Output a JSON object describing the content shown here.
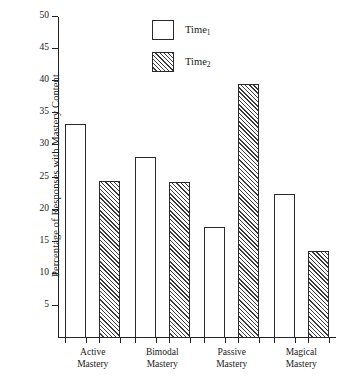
{
  "chart_data": {
    "type": "bar",
    "title": "",
    "xlabel": "",
    "ylabel": "Percentage of Responses with Mastery Content",
    "categories": [
      "Active Mastery",
      "Bimodal Mastery",
      "Passive Mastery",
      "Magical Mastery"
    ],
    "category_lines": [
      [
        "Active",
        "Mastery"
      ],
      [
        "Bimodal",
        "Mastery"
      ],
      [
        "Passive",
        "Mastery"
      ],
      [
        "Magical",
        "Mastery"
      ]
    ],
    "series": [
      {
        "name": "Time1",
        "name_base": "Time",
        "name_sub": "1",
        "fill": "white",
        "values": [
          33.3,
          28.2,
          17.3,
          22.5
        ]
      },
      {
        "name": "Time2",
        "name_base": "Time",
        "name_sub": "2",
        "fill": "hatched",
        "values": [
          24.5,
          24.3,
          39.5,
          13.5
        ]
      }
    ],
    "ylim": [
      0,
      50
    ],
    "ytick_values": [
      5,
      10,
      15,
      20,
      25,
      30,
      35,
      40,
      45,
      50
    ],
    "ytick_labels": [
      "5",
      "10",
      "15",
      "20",
      "25",
      "30",
      "35",
      "40",
      "45",
      "50"
    ],
    "grid": false,
    "legend_position": "top-center",
    "axis_color": "#222222",
    "bar_edge_color": "#2a2a2a",
    "hatch_color": "#3a3a3a",
    "background": "#ffffff"
  },
  "legend": {
    "entries": [
      {
        "label_base": "Time",
        "label_sub": "1",
        "style": "white"
      },
      {
        "label_base": "Time",
        "label_sub": "2",
        "style": "hatched"
      }
    ]
  },
  "axes": {
    "y_title": "Percentage of Responses with Mastery Content"
  }
}
